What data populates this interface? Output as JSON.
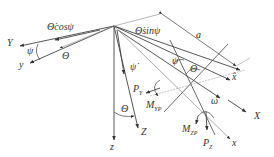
{
  "diagram": {
    "type": "coordinate-frame-geometry",
    "labels": {
      "Y": "Y",
      "y": "y",
      "theta_dot_cos_psi": "Θ̇cosψ",
      "theta_dot_sin_psi": "Θ̇sinψ",
      "theta_left": "Θ",
      "psi_left": "ψ",
      "a": "a",
      "psi_dot": "ψ̇",
      "psi_right": "ψ",
      "theta_right": "Θ",
      "x_hat": "x̂",
      "omega": "ω",
      "X": "X",
      "x": "x",
      "z": "z",
      "Z": "Z",
      "theta_bottom": "Θ",
      "P_Y": "P",
      "P_Y_sub": "Y",
      "M_YP": "M",
      "M_YP_sub": "YP",
      "M_ZP": "M",
      "M_ZP_sub": "ZP",
      "P_Z": "P",
      "P_Z_sub": "Z"
    },
    "colors": {
      "line": "#444444",
      "thin_line": "#888888",
      "text": "#333333"
    }
  }
}
